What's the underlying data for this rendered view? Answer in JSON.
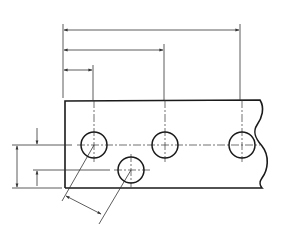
{
  "diagram": {
    "type": "engineering-drawing",
    "stroke_color": "#1a1a1a",
    "thin_stroke_color": "#333333",
    "background": "#ffffff",
    "plate": {
      "left": 65,
      "top": 101,
      "bottom": 188,
      "right": 262
    },
    "holes": [
      {
        "id": "hole-1",
        "cx": 94,
        "cy": 145,
        "r": 13
      },
      {
        "id": "hole-2",
        "cx": 165,
        "cy": 145,
        "r": 13
      },
      {
        "id": "hole-3",
        "cx": 242,
        "cy": 145,
        "r": 13
      },
      {
        "id": "hole-4",
        "cx": 131,
        "cy": 170,
        "r": 13
      }
    ],
    "horizontal_dimensions": [
      {
        "id": "dim-hole-3",
        "y": 30,
        "x1": 63,
        "x2": 240
      },
      {
        "id": "dim-hole-2",
        "y": 50,
        "x1": 63,
        "x2": 164
      },
      {
        "id": "dim-hole-1",
        "y": 70,
        "x1": 63,
        "x2": 93
      }
    ],
    "vertical_dimensions": [
      {
        "id": "dim-row-height",
        "x": 18,
        "y1": 145,
        "y2": 188
      },
      {
        "id": "dim-hole-offset",
        "x": 37,
        "y1": 145,
        "y2": 170
      }
    ],
    "angled_dimension": {
      "id": "dim-hole-spacing"
    },
    "labels": []
  }
}
